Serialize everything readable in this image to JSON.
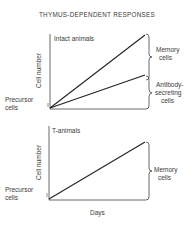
{
  "title": "THYMUS-DEPENDENT RESPONSES",
  "panels": [
    {
      "label": "Intact animals",
      "ylabel": "Cell number",
      "origin_label": [
        "Precursor",
        "cells"
      ],
      "brackets": [
        {
          "label": [
            "Memory",
            "cells"
          ]
        },
        {
          "label": [
            "Antibody-",
            "secreting",
            "cells"
          ]
        }
      ]
    },
    {
      "label": "T-animals",
      "ylabel": "Cell number",
      "origin_label": [
        "Precursor",
        "cells"
      ],
      "brackets": [
        {
          "label": [
            "Memory",
            "cells"
          ]
        }
      ]
    }
  ],
  "xlabel": "Days",
  "colors": {
    "line": "#333333",
    "text": "#3a3a3a"
  }
}
